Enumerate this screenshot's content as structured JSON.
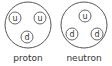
{
  "particles": [
    {
      "label": "proton",
      "center": [
        28,
        25
      ],
      "radius": 23,
      "quarks": [
        {
          "name": "u",
          "pos": [
            15,
            18
          ]
        },
        {
          "name": "u",
          "pos": [
            40,
            18
          ]
        },
        {
          "name": "d",
          "pos": [
            27,
            37
          ]
        }
      ]
    },
    {
      "label": "neutron",
      "center": [
        84,
        25
      ],
      "radius": 23,
      "quarks": [
        {
          "name": "u",
          "pos": [
            85,
            16
          ]
        },
        {
          "name": "d",
          "pos": [
            72,
            34
          ]
        },
        {
          "name": "d",
          "pos": [
            97,
            34
          ]
        }
      ]
    }
  ],
  "colors": {
    "stroke": "#555555",
    "text": "#333333"
  }
}
